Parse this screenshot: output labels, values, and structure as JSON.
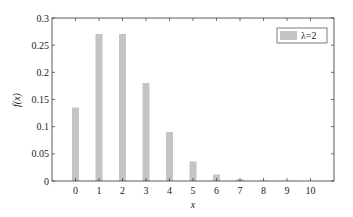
{
  "chart_data": {
    "type": "bar",
    "title": "",
    "xlabel": "x",
    "ylabel": "f(x)",
    "categories": [
      "0",
      "1",
      "2",
      "3",
      "4",
      "5",
      "6",
      "7",
      "8",
      "9",
      "10"
    ],
    "x": [
      0,
      1,
      2,
      3,
      4,
      5,
      6,
      7,
      8,
      9,
      10
    ],
    "series": [
      {
        "name": "λ=2",
        "color": "#c4c4c4",
        "values": [
          0.1353,
          0.2707,
          0.2707,
          0.1804,
          0.0902,
          0.0361,
          0.012,
          0.0034,
          0.0009,
          0.0002,
          4e-05
        ]
      }
    ],
    "xlim": [
      -1,
      11
    ],
    "ylim": [
      0,
      0.3
    ],
    "yticks": [
      0,
      0.05,
      0.1,
      0.15,
      0.2,
      0.25,
      0.3
    ],
    "ytick_labels": [
      "0",
      "0.05",
      "0.1",
      "0.15",
      "0.2",
      "0.25",
      "0.3"
    ],
    "xticks": [
      0,
      1,
      2,
      3,
      4,
      5,
      6,
      7,
      8,
      9,
      10
    ],
    "xtick_labels": [
      "0",
      "1",
      "2",
      "3",
      "4",
      "5",
      "6",
      "7",
      "8",
      "9",
      "10"
    ],
    "grid": false,
    "legend_position": "upper right"
  },
  "legend": {
    "label": "λ=2"
  },
  "axes": {
    "xlabel": "x",
    "ylabel": "f(x)"
  }
}
